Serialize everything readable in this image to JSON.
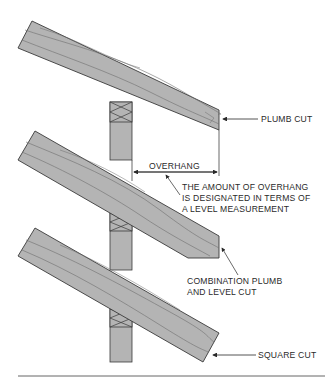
{
  "figure": {
    "colors": {
      "wood": "#b4b4b4",
      "grain": "#6e6e6e",
      "outline": "#3a3a3a",
      "text": "#2a2a2a",
      "background": "#ffffff"
    },
    "rafters": [
      {
        "id": "top",
        "cut": "plumb"
      },
      {
        "id": "middle",
        "cut": "combination plumb and level"
      },
      {
        "id": "bottom",
        "cut": "square"
      }
    ],
    "labels": {
      "plumb_cut": "PLUMB CUT",
      "overhang": "OVERHANG",
      "overhang_note": [
        "THE AMOUNT OF OVERHANG",
        "IS DESIGNATED IN TERMS OF",
        "A LEVEL MEASUREMENT"
      ],
      "combination_cut": [
        "COMBINATION PLUMB",
        "AND LEVEL CUT"
      ],
      "square_cut": "SQUARE CUT"
    }
  }
}
